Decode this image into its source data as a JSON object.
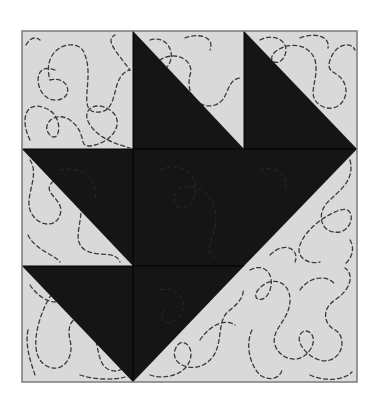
{
  "diagram": {
    "type": "quilt-block",
    "colors": {
      "background": "#ffffff",
      "light_fabric": "#d9d9d9",
      "dark_fabric": "#151515",
      "quilting_stitch": "#3a3a3a",
      "border": "#7a7a7a",
      "seam": "#000000"
    },
    "grid": {
      "left": 22,
      "top": 31,
      "right": 357,
      "bottom": 382,
      "cols": [
        22,
        133,
        244,
        357
      ],
      "rows": [
        31,
        149,
        266,
        382
      ]
    },
    "dark_shapes": [
      {
        "name": "top-middle-triangle",
        "points": "133,31 133,149 244,149"
      },
      {
        "name": "top-right-triangle",
        "points": "244,31 244,149 357,149"
      },
      {
        "name": "middle-left-triangle",
        "points": "22,149 133,149 133,266"
      },
      {
        "name": "center-square",
        "points": "133,149 244,149 244,266 133,266"
      },
      {
        "name": "middle-right-triangle",
        "points": "244,149 357,149 244,266"
      },
      {
        "name": "bottom-left-triangle",
        "points": "22,266 133,266 133,382"
      },
      {
        "name": "bottom-middle-triangle",
        "points": "133,266 244,266 133,382"
      }
    ]
  }
}
